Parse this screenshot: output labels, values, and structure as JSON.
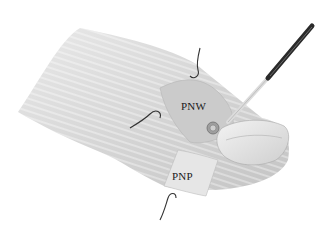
{
  "figure": {
    "labels": {
      "pnw": "PNW",
      "pnp": "PNP"
    }
  }
}
